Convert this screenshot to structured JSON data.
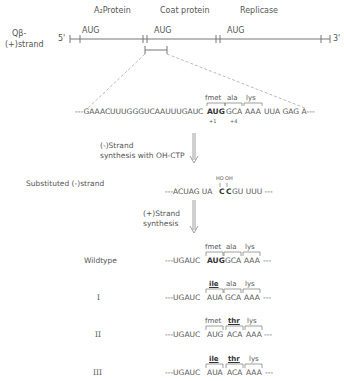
{
  "genome": {
    "label_line1": "Qβ-",
    "label_line2": "(+)strand",
    "five_prime": "5'",
    "three_prime": "3'",
    "genes": [
      {
        "name": "A₂Protein",
        "start_codon": "AUG"
      },
      {
        "name": "Coat protein",
        "start_codon": "AUG"
      },
      {
        "name": "Replicase",
        "start_codon": "AUG"
      }
    ]
  },
  "plus_strand_seq": {
    "prefix": "---GAAACUUUGGGUCAAUUUGAUC",
    "codons": [
      "AUG",
      "GCA",
      "AAA"
    ],
    "suffix": "UUA GAG A---",
    "amino_acids": [
      "fmet",
      "ala",
      "lys"
    ],
    "positions": [
      "+1",
      "+4"
    ]
  },
  "step1": {
    "line1": "(-)Strand",
    "line2": "synthesis with OH-CTP"
  },
  "substituted": {
    "label": "Substituted (-)strand",
    "sequence_prefix": "---ACUAG UA",
    "mod_c1": "C",
    "mod_c2": "C",
    "sequence_mid": "GU UUU ---",
    "ho_label": "HO",
    "oh_label": "OH"
  },
  "step2": {
    "line1": "(+)Strand",
    "line2": "synthesis"
  },
  "variants": [
    {
      "label": "Wildtype",
      "prefix": "---UGAUC",
      "codons": [
        "AUG",
        "GCA",
        "AAA"
      ],
      "amino_acids": [
        "fmet",
        "ala",
        "lys"
      ],
      "suffix": "---"
    },
    {
      "label": "I",
      "prefix": "---UGAUC",
      "codons": [
        "AUA",
        "GCA",
        "AAA"
      ],
      "amino_acids": [
        "ile",
        "ala",
        "lys"
      ],
      "suffix": "---"
    },
    {
      "label": "II",
      "prefix": "---UGAUC",
      "codons": [
        "AUG",
        "ACA",
        "AAA"
      ],
      "amino_acids": [
        "fmet",
        "thr",
        "lys"
      ],
      "suffix": "---"
    },
    {
      "label": "III",
      "prefix": "---UGAUC",
      "codons": [
        "AUA",
        "ACA",
        "AAA"
      ],
      "amino_acids": [
        "ile",
        "thr",
        "lys"
      ],
      "suffix": "---"
    }
  ]
}
